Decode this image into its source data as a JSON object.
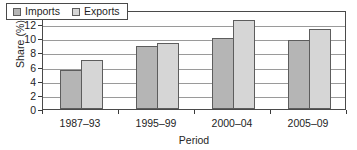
{
  "chart_data": {
    "type": "bar",
    "title": "",
    "subtitle": "",
    "xlabel": "Period",
    "ylabel": "Share (%)",
    "categories": [
      "1987–93",
      "1995–99",
      "2000–04",
      "2005–09"
    ],
    "series": [
      {
        "name": "Imports",
        "values": [
          5.5,
          8.9,
          10.1,
          9.7
        ],
        "color": "#b5b5b5"
      },
      {
        "name": "Exports",
        "values": [
          6.9,
          9.4,
          12.6,
          11.25
        ],
        "color": "#d6d6d6"
      }
    ],
    "ylim": [
      0,
      14
    ],
    "ytick_values": [
      0,
      2,
      4,
      6,
      8,
      10,
      12,
      14
    ],
    "ytick_labels": [
      "0",
      "2",
      "4",
      "6",
      "8",
      "10",
      "12",
      "14"
    ],
    "grid": "horizontal",
    "legend_position": "top-left-inside",
    "legend_entries": [
      "Imports",
      "Exports"
    ],
    "bar_border_color": "#5d5d5d",
    "frame_color": "#4a4a4a",
    "gridline_color": "#9a9a9a"
  }
}
